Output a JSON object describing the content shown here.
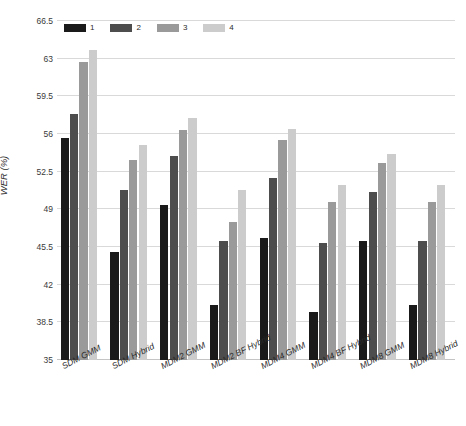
{
  "chart_data": {
    "type": "bar",
    "title": "",
    "xlabel": "",
    "ylabel": "WER (%)",
    "ylim": [
      35,
      66.5
    ],
    "yticks": [
      35,
      38.5,
      42,
      45.5,
      49,
      52.5,
      56,
      59.5,
      63,
      66.5
    ],
    "ytick_labels": [
      "35",
      "38.5",
      "42",
      "45.5",
      "49",
      "52.5",
      "56",
      "59.5",
      "63",
      "66.5"
    ],
    "grid": true,
    "legend_position": "top-left",
    "categories": [
      "SDM GMM",
      "SDM Hybrid",
      "MDM2 GMM",
      "MDM2 BF Hybrid",
      "MDM4 GMM",
      "MDM4 BF Hybrid",
      "MDM8 GMM",
      "MDM8 Hybrid"
    ],
    "series": [
      {
        "name": "1",
        "color": "#1a1a1a",
        "values": [
          55.6,
          45.0,
          49.4,
          40.1,
          46.3,
          39.5,
          46.1,
          40.1
        ]
      },
      {
        "name": "2",
        "color": "#4d4d4d",
        "values": [
          57.9,
          50.8,
          54.0,
          46.1,
          51.9,
          45.9,
          50.6,
          46.1
        ]
      },
      {
        "name": "3",
        "color": "#9a9a9a",
        "values": [
          62.7,
          53.6,
          56.4,
          47.8,
          55.4,
          49.7,
          53.3,
          49.7
        ]
      },
      {
        "name": "4",
        "color": "#cccccc",
        "values": [
          63.8,
          55.0,
          57.5,
          50.8,
          56.5,
          51.3,
          54.1,
          51.3
        ]
      }
    ]
  },
  "colors": {
    "gridline": "#d9d9d9",
    "axis_text": "#2b2b2b",
    "background": "#ffffff"
  }
}
